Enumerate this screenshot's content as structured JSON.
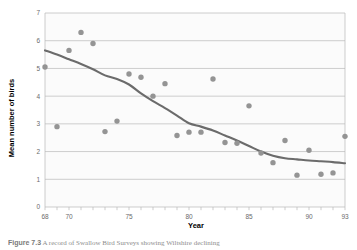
{
  "figure": {
    "caption_label": "Figure 7.3",
    "caption_text": "A record of Swallow Bird Surveys showing Wiltshire declining"
  },
  "chart_data": {
    "type": "scatter",
    "title": "",
    "xlabel": "Year",
    "ylabel": "Mean number of birds",
    "xlim": [
      68,
      93
    ],
    "ylim": [
      0,
      7
    ],
    "grid": true,
    "legend": "none",
    "x_tick_labels": [
      "68",
      "70",
      "75",
      "80",
      "85",
      "90",
      "93"
    ],
    "x_tick_values": [
      68,
      70,
      75,
      80,
      85,
      90,
      93
    ],
    "x_minor_tick_step": 1,
    "y_tick_labels": [
      "0",
      "1",
      "2",
      "3",
      "4",
      "5",
      "6",
      "7"
    ],
    "y_tick_values": [
      0,
      1,
      2,
      3,
      4,
      5,
      6,
      7
    ],
    "marker_color": "#949494",
    "line_color": "#6b6b6b",
    "plot_background": "#fbfbfb",
    "gridline_color": "#b8b8b8",
    "series": [
      {
        "name": "Mean number of birds",
        "type": "scatter",
        "x": [
          68,
          69,
          70,
          71,
          72,
          73,
          74,
          75,
          76,
          77,
          78,
          79,
          80,
          81,
          82,
          83,
          84,
          85,
          86,
          87,
          88,
          89,
          90,
          91,
          92,
          93
        ],
        "values": [
          5.05,
          2.9,
          5.65,
          6.3,
          5.9,
          2.72,
          3.1,
          4.8,
          4.68,
          4.0,
          4.45,
          2.58,
          2.7,
          2.7,
          4.62,
          2.33,
          2.3,
          3.65,
          1.95,
          1.6,
          2.4,
          1.15,
          2.05,
          1.18,
          1.23,
          2.55
        ]
      },
      {
        "name": "Smoothed trend",
        "type": "line",
        "x": [
          68,
          69,
          70,
          71,
          72,
          73,
          74,
          75,
          76,
          77,
          78,
          79,
          80,
          81,
          82,
          83,
          84,
          85,
          86,
          87,
          88,
          89,
          90,
          91,
          92,
          93
        ],
        "values": [
          5.65,
          5.5,
          5.33,
          5.16,
          4.97,
          4.75,
          4.62,
          4.42,
          4.1,
          3.82,
          3.57,
          3.3,
          3.02,
          2.9,
          2.76,
          2.58,
          2.4,
          2.2,
          2.0,
          1.85,
          1.76,
          1.72,
          1.68,
          1.65,
          1.62,
          1.58
        ]
      }
    ]
  }
}
